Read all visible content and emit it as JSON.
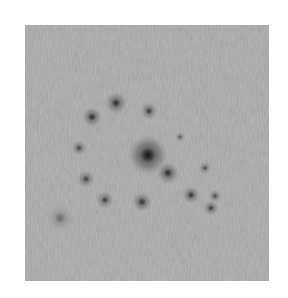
{
  "image": {
    "description": "Grayscale diffraction-style pattern with dark spots on a noisy gray field",
    "background_color": "#a9a9a9",
    "frame": {
      "x": 25,
      "y": 25,
      "width": 244,
      "height": 256
    },
    "spots": [
      {
        "x": 148,
        "y": 155,
        "r": 9,
        "opacity": 0.95,
        "label": "central-spot"
      },
      {
        "x": 168,
        "y": 173,
        "r": 5,
        "opacity": 0.7
      },
      {
        "x": 92,
        "y": 117,
        "r": 4.5,
        "opacity": 0.7
      },
      {
        "x": 116,
        "y": 103,
        "r": 5,
        "opacity": 0.7
      },
      {
        "x": 149,
        "y": 111,
        "r": 4,
        "opacity": 0.6
      },
      {
        "x": 180,
        "y": 137,
        "r": 2.5,
        "opacity": 0.4
      },
      {
        "x": 79,
        "y": 148,
        "r": 3.5,
        "opacity": 0.55
      },
      {
        "x": 86,
        "y": 179,
        "r": 4,
        "opacity": 0.55
      },
      {
        "x": 105,
        "y": 200,
        "r": 4,
        "opacity": 0.6
      },
      {
        "x": 142,
        "y": 202,
        "r": 4.5,
        "opacity": 0.65
      },
      {
        "x": 191,
        "y": 195,
        "r": 4,
        "opacity": 0.65
      },
      {
        "x": 205,
        "y": 168,
        "r": 3,
        "opacity": 0.45
      },
      {
        "x": 215,
        "y": 196,
        "r": 3,
        "opacity": 0.5
      },
      {
        "x": 211,
        "y": 208,
        "r": 3.5,
        "opacity": 0.6
      },
      {
        "x": 60,
        "y": 218,
        "r": 6,
        "opacity": 0.3,
        "label": "streaky-cluster"
      }
    ]
  }
}
